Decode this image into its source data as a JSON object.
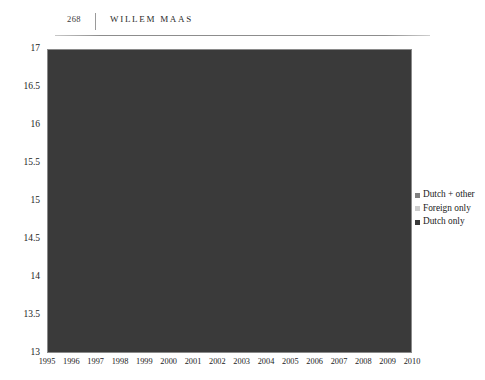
{
  "page": {
    "folio": "268",
    "running_title": "WILLEM MAAS"
  },
  "legend": {
    "position": "right",
    "items": [
      {
        "label": "Dutch + other",
        "color": "#808080"
      },
      {
        "label": "Foreign only",
        "color": "#cccccc"
      },
      {
        "label": "Dutch only",
        "color": "#3a3a3a"
      }
    ]
  },
  "chart_data": {
    "type": "area",
    "title": "",
    "xlabel": "",
    "ylabel": "",
    "stacked": true,
    "grid": true,
    "ylim": [
      13,
      17
    ],
    "yticks": [
      "13",
      "13.5",
      "14",
      "14.5",
      "15",
      "15.5",
      "16",
      "16.5",
      "17"
    ],
    "ytick_values": [
      13,
      13.5,
      14,
      14.5,
      15,
      15.5,
      16,
      16.5,
      17
    ],
    "categories": [
      "1995",
      "1996",
      "1997",
      "1998",
      "1999",
      "2000",
      "2001",
      "2002",
      "2003",
      "2004",
      "2005",
      "2006",
      "2007",
      "2008",
      "2009",
      "2010"
    ],
    "series": [
      {
        "name": "Dutch only",
        "color": "#3a3a3a",
        "values": [
          14.22,
          14.25,
          14.28,
          14.31,
          14.34,
          14.37,
          14.41,
          14.45,
          14.49,
          14.53,
          14.56,
          14.58,
          14.6,
          14.63,
          14.66,
          14.7
        ]
      },
      {
        "name": "Foreign only",
        "color": "#cccccc",
        "values": [
          0.73,
          0.72,
          0.71,
          0.71,
          0.71,
          0.72,
          0.73,
          0.75,
          0.76,
          0.77,
          0.77,
          0.76,
          0.74,
          0.72,
          0.71,
          0.7
        ]
      },
      {
        "name": "Dutch + other",
        "color": "#808080",
        "values": [
          0.45,
          0.48,
          0.51,
          0.55,
          0.61,
          0.68,
          0.76,
          0.9,
          0.99,
          1.05,
          1.09,
          1.11,
          1.13,
          1.14,
          1.15,
          1.15
        ]
      }
    ],
    "cumulative_tops": {
      "Dutch only": [
        14.22,
        14.25,
        14.28,
        14.31,
        14.34,
        14.37,
        14.41,
        14.45,
        14.49,
        14.53,
        14.56,
        14.58,
        14.6,
        14.63,
        14.66,
        14.7
      ],
      "Foreign only": [
        14.95,
        14.97,
        14.99,
        15.02,
        15.05,
        15.09,
        15.14,
        15.2,
        15.25,
        15.3,
        15.33,
        15.34,
        15.34,
        15.35,
        15.37,
        15.4
      ],
      "Dutch + other": [
        15.4,
        15.45,
        15.5,
        15.57,
        15.66,
        15.77,
        15.9,
        16.1,
        16.24,
        16.35,
        16.42,
        16.45,
        16.47,
        16.49,
        16.52,
        16.55
      ]
    }
  }
}
